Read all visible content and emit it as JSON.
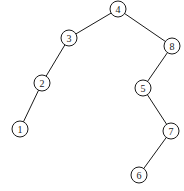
{
  "diagram": {
    "type": "binary-search-tree",
    "root": "4",
    "nodes": [
      {
        "id": "4",
        "label": "4"
      },
      {
        "id": "3",
        "label": "3"
      },
      {
        "id": "8",
        "label": "8"
      },
      {
        "id": "2",
        "label": "2"
      },
      {
        "id": "5",
        "label": "5"
      },
      {
        "id": "1",
        "label": "1"
      },
      {
        "id": "7",
        "label": "7"
      },
      {
        "id": "6",
        "label": "6"
      }
    ],
    "edges": [
      {
        "from": "4",
        "to": "3",
        "side": "left"
      },
      {
        "from": "4",
        "to": "8",
        "side": "right"
      },
      {
        "from": "3",
        "to": "2",
        "side": "left"
      },
      {
        "from": "2",
        "to": "1",
        "side": "left"
      },
      {
        "from": "8",
        "to": "5",
        "side": "left"
      },
      {
        "from": "5",
        "to": "7",
        "side": "right"
      },
      {
        "from": "7",
        "to": "6",
        "side": "left"
      }
    ]
  }
}
